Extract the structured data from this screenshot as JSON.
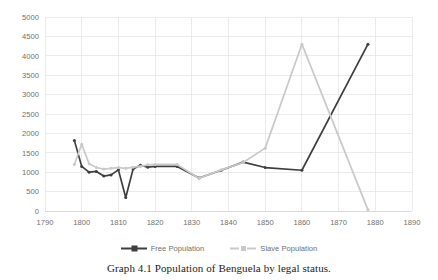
{
  "caption": "Graph 4.1  Population of Benguela by legal status.",
  "legend": {
    "items": [
      {
        "label": "Free Population",
        "color": "#3e3e3e",
        "icon": "line-marker-icon"
      },
      {
        "label": "Slave Population",
        "color": "#c9c9c9",
        "icon": "line-marker-icon"
      }
    ]
  },
  "chart_data": {
    "type": "line",
    "title": "",
    "xlabel": "",
    "ylabel": "",
    "xlim": [
      1790,
      1890
    ],
    "ylim": [
      0,
      5000
    ],
    "grid": true,
    "legend_position": "bottom",
    "x_ticks": [
      1790,
      1800,
      1810,
      1820,
      1830,
      1840,
      1850,
      1860,
      1870,
      1880,
      1890
    ],
    "y_ticks": [
      0,
      500,
      1000,
      1500,
      2000,
      2500,
      3000,
      3500,
      4000,
      4500,
      5000
    ],
    "series": [
      {
        "name": "Free Population",
        "color": "#3e3e3e",
        "points": [
          {
            "x": 1798,
            "y": 1820
          },
          {
            "x": 1800,
            "y": 1150
          },
          {
            "x": 1802,
            "y": 1000
          },
          {
            "x": 1804,
            "y": 1020
          },
          {
            "x": 1806,
            "y": 900
          },
          {
            "x": 1808,
            "y": 930
          },
          {
            "x": 1810,
            "y": 1060
          },
          {
            "x": 1812,
            "y": 350
          },
          {
            "x": 1814,
            "y": 1080
          },
          {
            "x": 1816,
            "y": 1180
          },
          {
            "x": 1818,
            "y": 1130
          },
          {
            "x": 1820,
            "y": 1150
          },
          {
            "x": 1826,
            "y": 1150
          },
          {
            "x": 1832,
            "y": 850
          },
          {
            "x": 1838,
            "y": 1050
          },
          {
            "x": 1844,
            "y": 1260
          },
          {
            "x": 1850,
            "y": 1120
          },
          {
            "x": 1860,
            "y": 1050
          },
          {
            "x": 1878,
            "y": 4300
          }
        ]
      },
      {
        "name": "Slave Population",
        "color": "#c9c9c9",
        "points": [
          {
            "x": 1798,
            "y": 1200
          },
          {
            "x": 1800,
            "y": 1720
          },
          {
            "x": 1802,
            "y": 1220
          },
          {
            "x": 1804,
            "y": 1120
          },
          {
            "x": 1806,
            "y": 1080
          },
          {
            "x": 1808,
            "y": 1100
          },
          {
            "x": 1810,
            "y": 1120
          },
          {
            "x": 1812,
            "y": 1100
          },
          {
            "x": 1814,
            "y": 1130
          },
          {
            "x": 1816,
            "y": 1150
          },
          {
            "x": 1818,
            "y": 1190
          },
          {
            "x": 1820,
            "y": 1200
          },
          {
            "x": 1826,
            "y": 1200
          },
          {
            "x": 1832,
            "y": 840
          },
          {
            "x": 1838,
            "y": 1060
          },
          {
            "x": 1844,
            "y": 1250
          },
          {
            "x": 1850,
            "y": 1620
          },
          {
            "x": 1860,
            "y": 4300
          },
          {
            "x": 1878,
            "y": 30
          }
        ]
      }
    ]
  }
}
